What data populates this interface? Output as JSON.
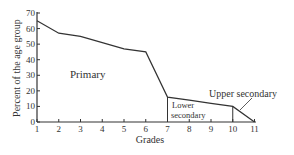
{
  "chart_data": {
    "type": "area",
    "title": "",
    "xlabel": "Grades",
    "ylabel": "Percent of the age group",
    "x": [
      1,
      2,
      3,
      4,
      5,
      6,
      7,
      8,
      9,
      10,
      11
    ],
    "values": [
      65,
      57,
      55,
      51,
      47,
      45,
      16,
      14,
      12,
      10,
      0
    ],
    "xlim": [
      1,
      11
    ],
    "ylim": [
      0,
      70
    ],
    "xticks": [
      "1",
      "2",
      "3",
      "4",
      "5",
      "6",
      "7",
      "8",
      "9",
      "10",
      "11"
    ],
    "yticks": [
      "0",
      "10",
      "20",
      "30",
      "40",
      "50",
      "60",
      "70"
    ],
    "grid": false,
    "regions": [
      {
        "name": "Primary",
        "from_grade": 1,
        "to_grade": 7
      },
      {
        "name": "Lower secondary",
        "from_grade": 7,
        "to_grade": 10
      },
      {
        "name": "Upper secondary",
        "from_grade": 10,
        "to_grade": 11
      }
    ],
    "annotations": [
      "Primary",
      "Lower secondary",
      "Upper secondary"
    ]
  },
  "labels": {
    "xlabel": "Grades",
    "ylabel": "Percent of the age group",
    "primary": "Primary",
    "lower_line1": "Lower",
    "lower_line2": "secondary",
    "upper": "Upper secondary"
  },
  "ticks": {
    "x": [
      "1",
      "2",
      "3",
      "4",
      "5",
      "6",
      "7",
      "8",
      "9",
      "10",
      "11"
    ],
    "y": [
      "0",
      "10",
      "20",
      "30",
      "40",
      "50",
      "60",
      "70"
    ]
  }
}
